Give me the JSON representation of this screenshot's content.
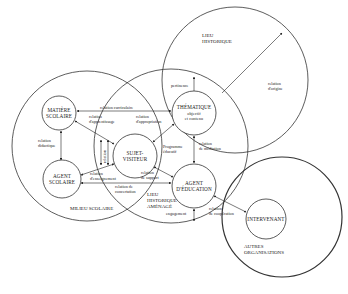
{
  "diagram": {
    "zones": {
      "lieu_historique": [
        "LIEU",
        "HISTORIQUE"
      ],
      "milieu_scolaire": "MILIEU SCOLAIRE",
      "lieu_amenage": [
        "LIEU",
        "HISTORIQUE",
        "AMÉNAGÉ"
      ],
      "autres_organisations": [
        "AUTRES",
        "ORGANISATIONS"
      ]
    },
    "nodes": {
      "matiere": [
        "MATIÈRE",
        "SCOLAIRE"
      ],
      "agent_scolaire": [
        "AGENT",
        "SCOLAIRE"
      ],
      "sujet": [
        "SUJET-",
        "VISITEUR"
      ],
      "thematique": [
        "THÉMATIQUE",
        "objectif",
        "et contenu"
      ],
      "agent_education": [
        "AGENT",
        "D'ÉDUCATION"
      ],
      "intervenant": "INTERVENANT"
    },
    "relations": {
      "curriculaire": "relation curriculaire",
      "apprentissage": [
        "relation",
        "d'apprentissage"
      ],
      "appropriation": [
        "relation",
        "d'appropriation"
      ],
      "didactique": [
        "relation",
        "didactique"
      ],
      "enseignement": [
        "relation",
        "d'enseignement"
      ],
      "concertation": [
        "relation de",
        "concertation"
      ],
      "support": [
        "relation",
        "de support"
      ],
      "programme": [
        "Programme",
        "éducatif"
      ],
      "mediation": [
        "relation",
        "de médiation"
      ],
      "pertinence": "pertinence",
      "origine": [
        "relation",
        "d'origine"
      ],
      "engagement": "engagement",
      "cooperation": [
        "relation",
        "de coopération"
      ],
      "vertical": "relation"
    }
  }
}
